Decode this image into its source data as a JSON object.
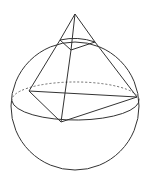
{
  "diagram": {
    "stroke_color": "#333333",
    "background": "#ffffff",
    "sphere": {
      "cx": 75,
      "cy": 106,
      "r": 64
    },
    "equator": {
      "cx": 75.5,
      "cy": 103,
      "rx": 63.5,
      "ry": 19
    },
    "apex": [
      75,
      14
    ],
    "top_quad": {
      "left": [
        60,
        40
      ],
      "front": [
        71,
        50
      ],
      "right": [
        95,
        42
      ],
      "back": [
        84,
        36
      ]
    },
    "base_quad": {
      "left": [
        29,
        91
      ],
      "front": [
        61,
        122
      ],
      "right": [
        137,
        97
      ]
    }
  }
}
